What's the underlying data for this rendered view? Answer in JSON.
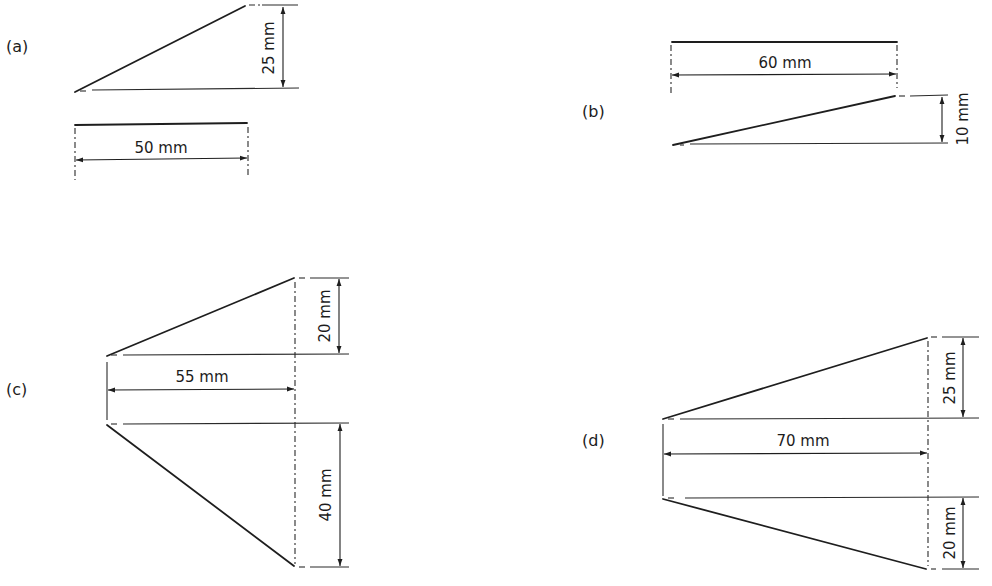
{
  "figure": {
    "line_color": "#1e1e1e",
    "background": "#ffffff",
    "panels": [
      {
        "id": "a",
        "label": "(a)",
        "shape": "right-triangle wedge",
        "dimensions": {
          "horizontal": "50 mm",
          "vertical": "25 mm"
        }
      },
      {
        "id": "b",
        "label": "(b)",
        "shape": "right-triangle wedge",
        "dimensions": {
          "horizontal": "60 mm",
          "vertical": "10 mm"
        }
      },
      {
        "id": "c",
        "label": "(c)",
        "shape": "asymmetric taper",
        "dimensions": {
          "horizontal": "55 mm",
          "vertical_top": "20 mm",
          "vertical_bottom": "40 mm"
        }
      },
      {
        "id": "d",
        "label": "(d)",
        "shape": "asymmetric taper",
        "dimensions": {
          "horizontal": "70 mm",
          "vertical_top": "25 mm",
          "vertical_bottom": "20 mm"
        }
      }
    ]
  }
}
